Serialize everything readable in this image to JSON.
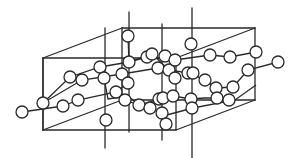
{
  "diagram": {
    "title": "Crystal structure unit cell with helical atom chains",
    "type": "crystal-lattice",
    "colors": {
      "line": "#2a2a2a",
      "atom_fill": "#ffffff",
      "background": "#ffffff"
    },
    "unit_cell": {
      "edges": [
        [
          43,
          58,
          122,
          28
        ],
        [
          122,
          28,
          255,
          28
        ],
        [
          43,
          58,
          176,
          58
        ],
        [
          176,
          58,
          255,
          28
        ],
        [
          43,
          58,
          43,
          130
        ],
        [
          255,
          28,
          255,
          100
        ],
        [
          43,
          130,
          176,
          130
        ],
        [
          176,
          130,
          255,
          100
        ],
        [
          122,
          28,
          122,
          100
        ],
        [
          176,
          58,
          176,
          130
        ],
        [
          43,
          130,
          122,
          100
        ],
        [
          122,
          100,
          255,
          100
        ]
      ]
    },
    "axes_lines": [
      [
        129,
        12,
        129,
        132
      ],
      [
        105,
        28,
        105,
        148
      ],
      [
        192,
        8,
        192,
        160
      ],
      [
        162,
        24,
        162,
        140
      ],
      [
        43,
        58,
        43,
        130
      ]
    ],
    "chains": [
      [
        [
          22,
          112
        ],
        [
          63,
          106
        ],
        [
          78,
          100
        ],
        [
          116,
          92
        ],
        [
          128,
          83
        ]
      ],
      [
        [
          43,
          103
        ],
        [
          70,
          77
        ],
        [
          100,
          67
        ],
        [
          129,
          62
        ],
        [
          147,
          57
        ],
        [
          175,
          60
        ],
        [
          210,
          55
        ],
        [
          230,
          57
        ],
        [
          256,
          52
        ]
      ],
      [
        [
          43,
          103
        ],
        [
          82,
          80
        ],
        [
          122,
          74
        ],
        [
          158,
          68
        ],
        [
          175,
          78
        ]
      ],
      [
        [
          100,
          67
        ],
        [
          104,
          78
        ],
        [
          108,
          99
        ],
        [
          128,
          96
        ],
        [
          139,
          105
        ],
        [
          150,
          108
        ]
      ],
      [
        [
          128,
          36
        ],
        [
          129,
          62
        ],
        [
          152,
          54
        ],
        [
          169,
          70
        ],
        [
          188,
          73
        ],
        [
          205,
          80
        ],
        [
          216,
          88
        ],
        [
          233,
          87
        ],
        [
          248,
          70
        ],
        [
          278,
          62
        ]
      ],
      [
        [
          159,
          99
        ],
        [
          173,
          96
        ],
        [
          191,
          99
        ],
        [
          204,
          98
        ],
        [
          217,
          98
        ],
        [
          229,
          100
        ]
      ],
      [
        [
          125,
          100
        ],
        [
          139,
          105
        ],
        [
          163,
          98
        ]
      ],
      [
        [
          163,
          116
        ],
        [
          193,
          108
        ],
        [
          235,
          100
        ],
        [
          256,
          85
        ]
      ]
    ],
    "atoms": [
      [
        22,
        112
      ],
      [
        43,
        103
      ],
      [
        63,
        106
      ],
      [
        70,
        77
      ],
      [
        78,
        100
      ],
      [
        82,
        80
      ],
      [
        100,
        67
      ],
      [
        104,
        78
      ],
      [
        106,
        120
      ],
      [
        116,
        92
      ],
      [
        122,
        74
      ],
      [
        125,
        100
      ],
      [
        128,
        36
      ],
      [
        128,
        83
      ],
      [
        129,
        62
      ],
      [
        139,
        105
      ],
      [
        147,
        57
      ],
      [
        150,
        108
      ],
      [
        152,
        54
      ],
      [
        158,
        68
      ],
      [
        159,
        99
      ],
      [
        162,
        113
      ],
      [
        163,
        98
      ],
      [
        165,
        56
      ],
      [
        166,
        124
      ],
      [
        169,
        70
      ],
      [
        173,
        96
      ],
      [
        175,
        60
      ],
      [
        175,
        78
      ],
      [
        188,
        73
      ],
      [
        191,
        44
      ],
      [
        191,
        99
      ],
      [
        192,
        108
      ],
      [
        193,
        73
      ],
      [
        205,
        80
      ],
      [
        210,
        55
      ],
      [
        216,
        88
      ],
      [
        217,
        98
      ],
      [
        229,
        100
      ],
      [
        230,
        57
      ],
      [
        233,
        87
      ],
      [
        248,
        70
      ],
      [
        256,
        52
      ],
      [
        278,
        62
      ]
    ]
  }
}
